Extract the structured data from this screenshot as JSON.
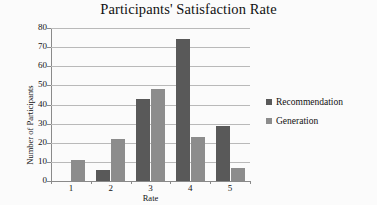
{
  "chart_data": {
    "type": "bar",
    "title": "Participants' Satisfaction Rate",
    "xlabel": "Rate",
    "ylabel": "Number of Participants",
    "categories": [
      "1",
      "2",
      "3",
      "4",
      "5"
    ],
    "series": [
      {
        "name": "Recommendation",
        "color": "#595959",
        "values": [
          0,
          6,
          43,
          74,
          29
        ]
      },
      {
        "name": "Generation",
        "color": "#8c8c8c",
        "values": [
          11,
          22,
          48,
          23,
          7
        ]
      }
    ],
    "ylim": [
      0,
      80
    ],
    "ytick_step": 10,
    "yticks": [
      "0",
      "10",
      "20",
      "30",
      "40",
      "50",
      "60",
      "70",
      "80"
    ],
    "grid": "horizontal",
    "legend_position": "right",
    "background": "#ffffff"
  },
  "legend": {
    "items": [
      {
        "label": "Recommendation",
        "color": "#595959"
      },
      {
        "label": "Generation",
        "color": "#8c8c8c"
      }
    ]
  }
}
